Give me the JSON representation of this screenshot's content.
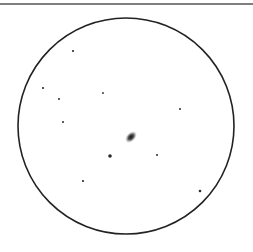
{
  "sketch": {
    "background": "#ffffff",
    "ink": "#2a2a2a",
    "top_rule": {
      "y": 4,
      "x1": 0,
      "x2": 253,
      "width": 1.5,
      "color": "#555555"
    },
    "field_of_view": {
      "cx": 126,
      "cy": 126,
      "r": 108,
      "stroke": "#222222",
      "stroke_width": 1.6
    },
    "object": {
      "name": "galaxy",
      "cx": 131,
      "cy": 137,
      "rx": 7,
      "ry": 4.5,
      "angle": -45,
      "color": "#1a1a1a"
    },
    "stars": [
      {
        "x": 73,
        "y": 51,
        "r": 1.1
      },
      {
        "x": 43,
        "y": 88,
        "r": 1.1
      },
      {
        "x": 59,
        "y": 99,
        "r": 1.0
      },
      {
        "x": 103,
        "y": 93,
        "r": 0.9
      },
      {
        "x": 63,
        "y": 122,
        "r": 1.0
      },
      {
        "x": 180,
        "y": 109,
        "r": 1.0
      },
      {
        "x": 110,
        "y": 156,
        "r": 1.8
      },
      {
        "x": 157,
        "y": 155,
        "r": 1.0
      },
      {
        "x": 83,
        "y": 181,
        "r": 1.1
      },
      {
        "x": 200,
        "y": 191,
        "r": 1.3
      }
    ]
  }
}
